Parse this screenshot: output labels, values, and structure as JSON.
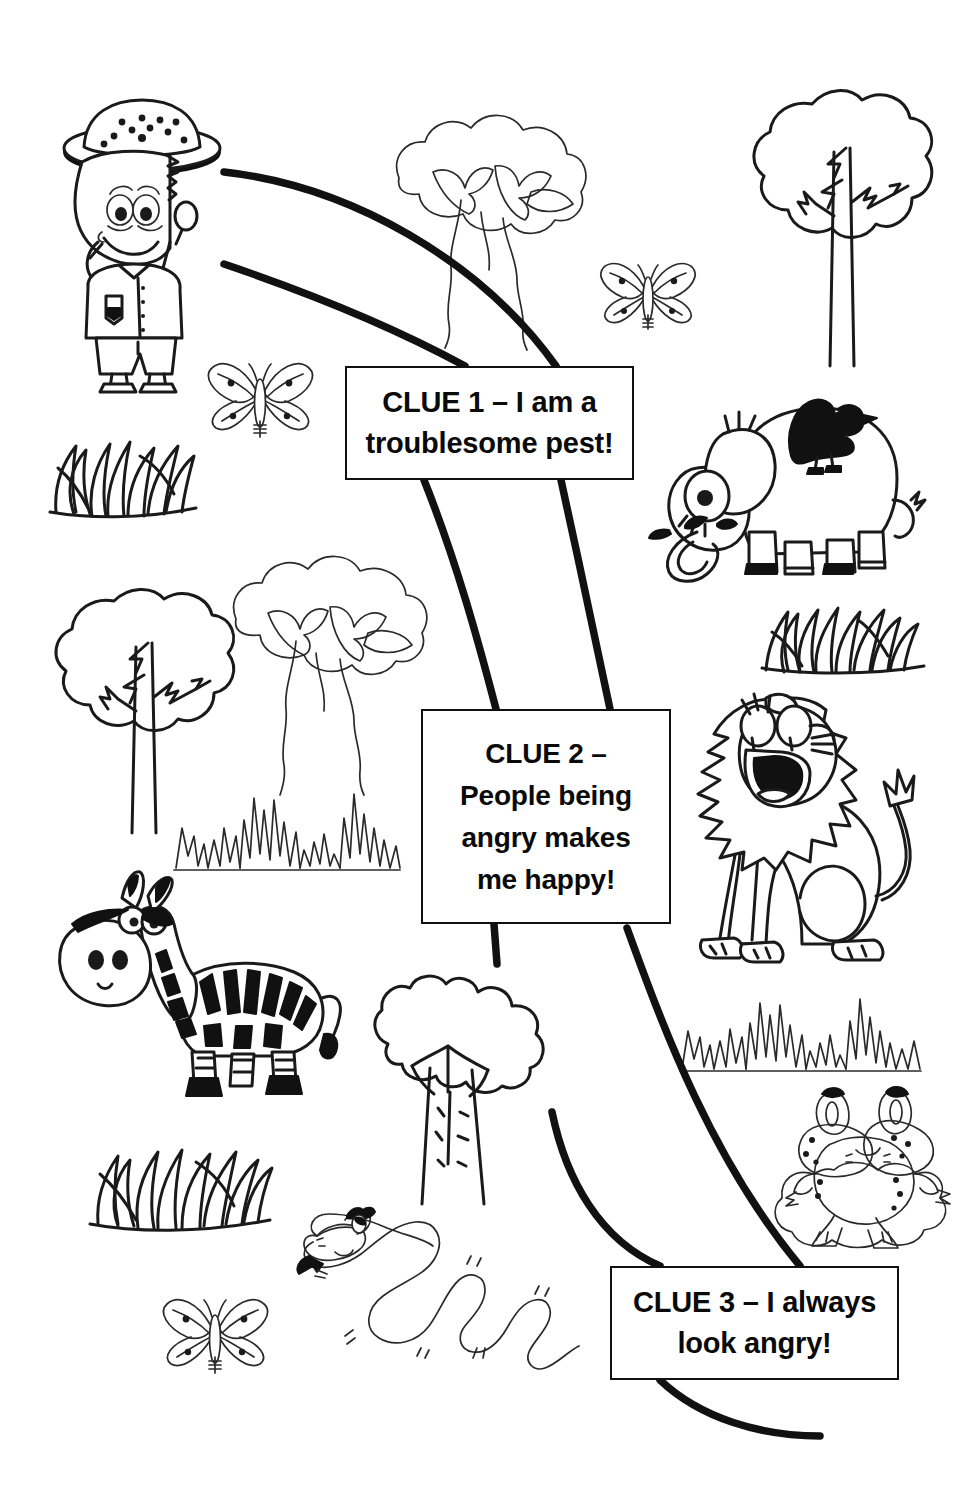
{
  "worksheet": {
    "title": "Safari Clue Trail",
    "theme": "african-savannah-guessing-game",
    "background_color": "#ffffff",
    "ink_color": "#111111",
    "page_width": 976,
    "page_height": 1493
  },
  "clues": [
    {
      "id": "clue-1",
      "label": "CLUE 1",
      "text": "CLUE 1 – I am a\ntroublesome pest!",
      "line_1": "CLUE 1 – I am a",
      "line_2": "troublesome pest!"
    },
    {
      "id": "clue-2",
      "label": "CLUE 2",
      "text": "CLUE 2 –\nPeople being\nangry makes\nme happy!",
      "line_1": "CLUE 2 –",
      "line_2": "People being",
      "line_3": "angry makes",
      "line_4": "me happy!"
    },
    {
      "id": "clue-3",
      "label": "CLUE 3",
      "text": "CLUE 3 – I always\nlook angry!",
      "line_1": "CLUE 3 – I always",
      "line_2": "look angry!"
    }
  ],
  "illustrations": [
    {
      "id": "explorer",
      "name": "explorer-with-magnifying-glass",
      "alt": "Cartoon safari explorer wearing a spotted pith helmet and holding a magnifying glass"
    },
    {
      "id": "tree-acacia-1",
      "name": "acacia-tree",
      "alt": "Acacia tree with a cloud-shaped canopy"
    },
    {
      "id": "tree-round-1",
      "name": "round-tree",
      "alt": "Round leafy tree with bare branches showing"
    },
    {
      "id": "butterfly-1",
      "name": "butterfly",
      "alt": "Spotted butterfly"
    },
    {
      "id": "butterfly-2",
      "name": "butterfly",
      "alt": "Spotted butterfly"
    },
    {
      "id": "grass-thick-1",
      "name": "grass-tuft",
      "alt": "Tuft of broad-bladed grass"
    },
    {
      "id": "elephant",
      "name": "elephant-with-bird",
      "alt": "Smiling elephant with a black bird perched on its back"
    },
    {
      "id": "tree-round-2",
      "name": "round-tree",
      "alt": "Round leafy tree with bare branches showing"
    },
    {
      "id": "tree-acacia-2",
      "name": "acacia-tree",
      "alt": "Acacia tree with a cloud-shaped canopy"
    },
    {
      "id": "grass-thin-1",
      "name": "grass-tuft-spiky",
      "alt": "Tuft of thin spiky grass"
    },
    {
      "id": "lion",
      "name": "roaring-lion",
      "alt": "Roaring lion sitting with its mouth wide open"
    },
    {
      "id": "grass-spiky-1",
      "name": "grass-tuft-spiky",
      "alt": "Tuft of thin spiky grass"
    },
    {
      "id": "zebra",
      "name": "zebra",
      "alt": "Cartoon zebra with striped body"
    },
    {
      "id": "tree-baobab",
      "name": "baobab-tree",
      "alt": "Baobab tree with a thick trunk"
    },
    {
      "id": "grass-spiky-2",
      "name": "grass-tuft-spiky",
      "alt": "Tuft of thin spiky grass"
    },
    {
      "id": "frog",
      "name": "frog",
      "alt": "Spotted frog sitting on a rock"
    },
    {
      "id": "grass-thick-2",
      "name": "grass-tuft",
      "alt": "Tuft of broad-bladed grass"
    },
    {
      "id": "snake",
      "name": "snake",
      "alt": "Wiggly snake with a forked tongue"
    },
    {
      "id": "butterfly-3",
      "name": "butterfly",
      "alt": "Spotted butterfly"
    }
  ],
  "trail": {
    "name": "safari-path",
    "description": "Two heavy parallel curving lines forming a winding path that links the explorer to each clue sign"
  }
}
